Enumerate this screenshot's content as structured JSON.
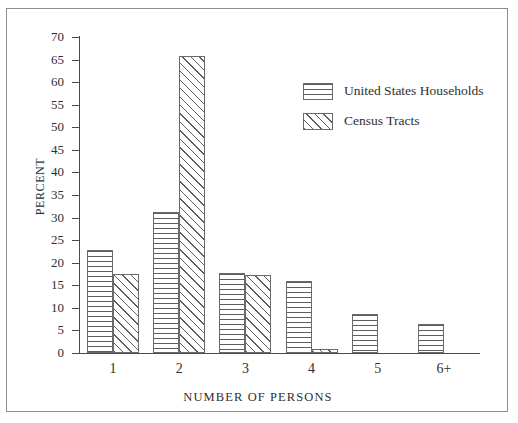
{
  "figure": {
    "top_artifact": "....... ....  ..",
    "border_color": "#8d8d8d"
  },
  "chart_data": {
    "type": "bar",
    "title": "",
    "subtitle": "",
    "xlabel": "NUMBER OF PERSONS",
    "ylabel": "PERCENT",
    "categories": [
      "1",
      "2",
      "3",
      "4",
      "5",
      "6+"
    ],
    "series": [
      {
        "name": "United States Households",
        "pattern": "horizontal-lines",
        "values": [
          22.8,
          31.3,
          17.8,
          16.0,
          8.6,
          6.4
        ]
      },
      {
        "name": "Census Tracts",
        "pattern": "diagonal-hatch",
        "values": [
          17.4,
          65.8,
          17.2,
          1.0,
          0,
          0
        ]
      }
    ],
    "ylim": [
      0,
      70
    ],
    "yticks": [
      0,
      5,
      10,
      15,
      20,
      25,
      30,
      35,
      40,
      45,
      50,
      55,
      60,
      65,
      70
    ],
    "ytick_labels": [
      "0",
      "5",
      "10",
      "15",
      "20",
      "25",
      "30",
      "35",
      "40",
      "45",
      "50",
      "55",
      "60",
      "65",
      "70"
    ],
    "grid": false,
    "legend_position": "inside-top-right",
    "bar_line_color": "#6a6a6a",
    "axis_color": "#4a4a4a",
    "text_color": "#2f2f2f"
  }
}
